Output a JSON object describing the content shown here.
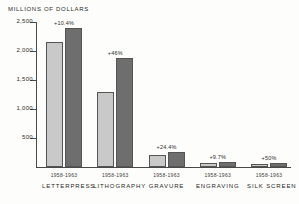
{
  "chart_data": {
    "type": "bar",
    "title": "MILLIONS OF DOLLARS",
    "xlabel": "",
    "ylabel": "MILLIONS OF DOLLARS",
    "ylim": [
      0,
      2500
    ],
    "yticks": [
      500,
      1000,
      1500,
      2000,
      2500
    ],
    "ytick_labels": [
      "500",
      "1,000",
      "1,500",
      "2,000",
      "2,500"
    ],
    "grid": false,
    "legend": "none",
    "categories": [
      "LETTERPRESS",
      "LITHOGRAPHY",
      "GRAVURE",
      "ENGRAVING",
      "SILK SCREEN"
    ],
    "period_labels": [
      "1958-1963",
      "1958-1963",
      "1958-1963",
      "1958-1963",
      "1958-1963"
    ],
    "series": [
      {
        "name": "1958",
        "values": [
          2150,
          1290,
          205,
          75,
          48
        ]
      },
      {
        "name": "1963",
        "values": [
          2400,
          1880,
          258,
          82,
          72
        ]
      }
    ],
    "annotations": [
      "+10.4%",
      "+46%",
      "+24.4%",
      "+9.7%",
      "+50%"
    ]
  },
  "axis": {
    "title": "MILLIONS OF DOLLARS"
  },
  "colors": {
    "bar_light": "#c9c9c9",
    "bar_dark": "#6e6e6e",
    "axis": "#4a4a4a",
    "text": "#2b2b2b",
    "background": "#fdfdfb"
  }
}
